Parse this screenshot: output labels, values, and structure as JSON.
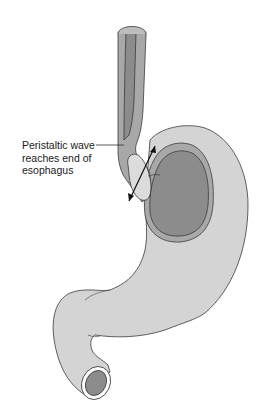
{
  "figure": {
    "label": {
      "lines": [
        "Peristaltic wave",
        "reaches end of",
        "esophagus"
      ]
    },
    "colors": {
      "background": "#ffffff",
      "stomach_outer": "#d4d4d4",
      "mucosa_mid": "#a8a8a8",
      "lumen_dark": "#8c8c8c",
      "bolus": "#dcdcdc",
      "outline": "#3a3a3a",
      "pylorus_ring": "#ffffff"
    },
    "parts": [
      "esophagus",
      "bolus",
      "lower-esophageal-sphincter-arrow",
      "fundus",
      "stomach-body",
      "pylorus",
      "duodenum-opening"
    ]
  }
}
